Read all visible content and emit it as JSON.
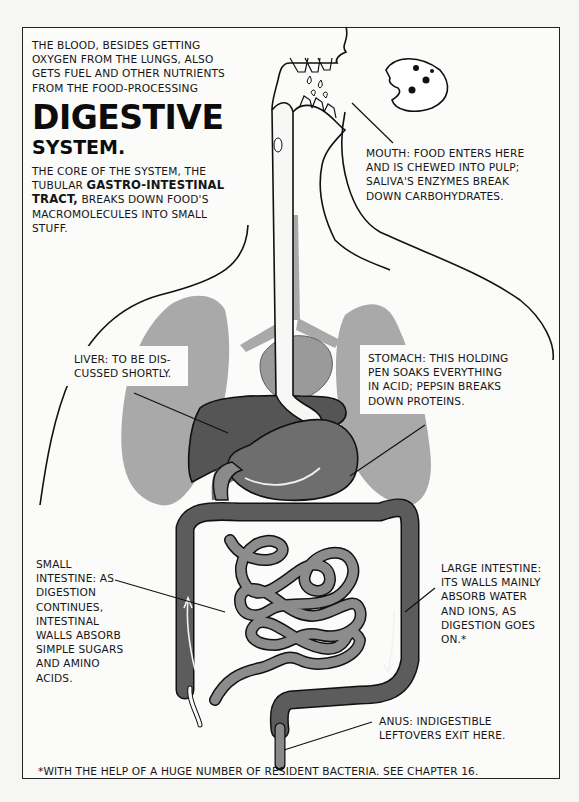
{
  "intro": {
    "lead_text": "THE BLOOD, BESIDES GETTING OXYGEN FROM THE LUNGS, ALSO GETS FUEL AND OTHER NUTRIENTS FROM THE FOOD-PROCESSING",
    "title_line1": "DIGESTIVE",
    "title_line2": "SYSTEM.",
    "body_part1": "THE CORE OF THE SYSTEM, THE TUBULAR ",
    "body_bold": "GASTRO-INTESTINAL TRACT,",
    "body_part2": " BREAKS DOWN FOOD'S MACROMOLECULES INTO SMALL STUFF."
  },
  "labels": {
    "mouth": "MOUTH: FOOD ENTERS HERE AND IS CHEWED INTO PULP; SALIVA'S ENZYMES BREAK DOWN CARBOHYDRATES.",
    "liver": "LIVER: TO BE DIS-CUSSED SHORTLY.",
    "stomach": "STOMACH: THIS HOLDING PEN SOAKS EVERYTHING IN ACID; PEPSIN BREAKS DOWN PROTEINS.",
    "small_intestine": "SMALL INTESTINE: AS DIGESTION CONTINUES, INTESTINAL WALLS ABSORB SIMPLE SUGARS AND AMINO ACIDS.",
    "large_intestine": "LARGE INTESTINE: ITS WALLS MAINLY ABSORB WATER AND IONS, AS DIGESTION GOES ON.*",
    "anus": "ANUS: INDIGESTIBLE LEFTOVERS EXIT HERE."
  },
  "footnote": "*WITH THE HELP OF A HUGE NUMBER OF RESIDENT BACTERIA. SEE CHAPTER 16.",
  "colors": {
    "lung": "#a9a9a9",
    "liver": "#555555",
    "stomach": "#6e6e6e",
    "small_intestine": "#8c8c8c",
    "large_intestine": "#5c5c5c",
    "outline": "#111111",
    "paper": "#fbfbfa"
  }
}
